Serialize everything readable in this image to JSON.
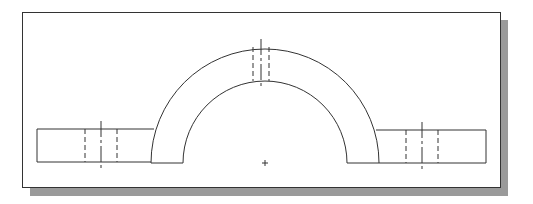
{
  "diagram": {
    "type": "technical-drawing",
    "view": "front-view",
    "colors": {
      "line": "#333333",
      "frame_border": "#333333",
      "shadow": "#9a9a9a",
      "background": "#ffffff"
    },
    "center_mark": {
      "x": 265,
      "y": 163,
      "symbol": "+"
    },
    "arch": {
      "center_x": 265,
      "center_y": 163,
      "outer_radius": 114,
      "inner_radius": 82
    },
    "flanges": [
      {
        "name": "left",
        "x1": 37,
        "x2": 152,
        "y_top": 129,
        "y_bottom": 162
      },
      {
        "name": "right",
        "x1": 378,
        "x2": 486,
        "y_top": 130,
        "y_bottom": 163
      }
    ],
    "holes": [
      {
        "name": "left",
        "hidden_x": [
          85,
          117
        ],
        "center_x": 101,
        "y1": 129,
        "y2": 162,
        "cl_y1": 121,
        "cl_y2": 170
      },
      {
        "name": "top",
        "hidden_x": [
          253,
          269
        ],
        "center_x": 261,
        "y1": 47,
        "y2": 81,
        "cl_y1": 39,
        "cl_y2": 88
      },
      {
        "name": "right",
        "hidden_x": [
          406,
          438
        ],
        "center_x": 422,
        "y1": 130,
        "y2": 163,
        "cl_y1": 122,
        "cl_y2": 171
      }
    ]
  }
}
